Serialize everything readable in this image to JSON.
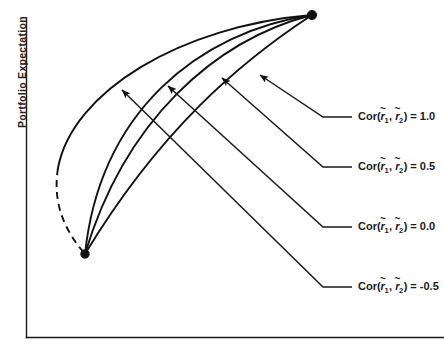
{
  "figure": {
    "type": "line-diagram",
    "background_color": "#ffffff",
    "line_color": "#111111",
    "width": 444,
    "height": 348,
    "axes": {
      "y_axis_label": "Portfolio Expectation",
      "x_axis_label": "",
      "y_axis_x_px": 26,
      "y_axis_top_px": 18,
      "y_axis_bottom_px": 337,
      "x_axis_y_px": 337,
      "x_axis_left_px": 26,
      "x_axis_right_px": 444,
      "tick_labels": [],
      "grid": "off"
    },
    "anchors": {
      "lower_left": {
        "x": 85,
        "y": 254
      },
      "upper_right": {
        "x": 312,
        "y": 15
      }
    }
  },
  "chart_data": {
    "type": "line",
    "title": "",
    "subtitle": "",
    "xlabel": "",
    "ylabel": "Portfolio Expectation",
    "grid": "off",
    "legend_position": "right-inline-callouts",
    "annotation_note": "Portfolio frontier curves between two risky assets at varying return correlations; all curves share the same two endpoints.",
    "series": [
      {
        "name": "Cor(r1,r2) = 1.0",
        "correlation": 1.0,
        "dashed": false,
        "path": "M 312 15 C 240 62, 160 130, 85 254",
        "callout": {
          "arrow_tip": {
            "x": 260,
            "y": 75
          },
          "elbow": {
            "x": 323,
            "y": 117
          },
          "text_anchor": {
            "x": 352,
            "y": 117
          }
        }
      },
      {
        "name": "Cor(r1,r2) = 0.5",
        "correlation": 0.5,
        "dashed": false,
        "path": "M 312 15 C 215 40, 125 120, 85 254",
        "callout": {
          "arrow_tip": {
            "x": 222,
            "y": 78
          },
          "elbow": {
            "x": 323,
            "y": 167
          },
          "text_anchor": {
            "x": 352,
            "y": 167
          }
        }
      },
      {
        "name": "Cor(r1,r2) = 0.0",
        "correlation": 0.0,
        "dashed": false,
        "path": "M 312 15 C 198 32, 100 112, 85 254",
        "callout": {
          "arrow_tip": {
            "x": 168,
            "y": 86
          },
          "elbow": {
            "x": 323,
            "y": 227
          },
          "text_anchor": {
            "x": 352,
            "y": 227
          }
        }
      },
      {
        "name": "Cor(r1,r2) = -0.5",
        "correlation": -0.5,
        "dashed": true,
        "path_solid": "M 312 15 C 180 26, 72 92, 58 168",
        "path_dashed": "M 58 168 C 52 205, 66 232, 85 254",
        "callout": {
          "arrow_tip": {
            "x": 122,
            "y": 90
          },
          "elbow": {
            "x": 323,
            "y": 287
          },
          "text_anchor": {
            "x": 352,
            "y": 287
          }
        }
      }
    ]
  },
  "legend": {
    "items": [
      {
        "prefix": "Cor(",
        "var1": "r",
        "sub1": "1",
        "separator": ", ",
        "var2": "r",
        "sub2": "2",
        "suffix": ") = ",
        "value": "1.0",
        "full_text": "Cor(r̃1, r̃2) = 1.0"
      },
      {
        "prefix": "Cor(",
        "var1": "r",
        "sub1": "1",
        "separator": ", ",
        "var2": "r",
        "sub2": "2",
        "suffix": ") = ",
        "value": "0.5",
        "full_text": "Cor(r̃1, r̃2) = 0.5"
      },
      {
        "prefix": "Cor(",
        "var1": "r",
        "sub1": "1",
        "separator": ", ",
        "var2": "r",
        "sub2": "2",
        "suffix": ") = ",
        "value": "0.0",
        "full_text": "Cor(r̃1, r̃2) = 0.0"
      },
      {
        "prefix": "Cor(",
        "var1": "r",
        "sub1": "1",
        "separator": ", ",
        "var2": "r",
        "sub2": "2",
        "suffix": ") = ",
        "value": "-0.5",
        "full_text": "Cor(r̃1, r̃2) = -0.5"
      }
    ],
    "tilde_glyph": "~"
  }
}
